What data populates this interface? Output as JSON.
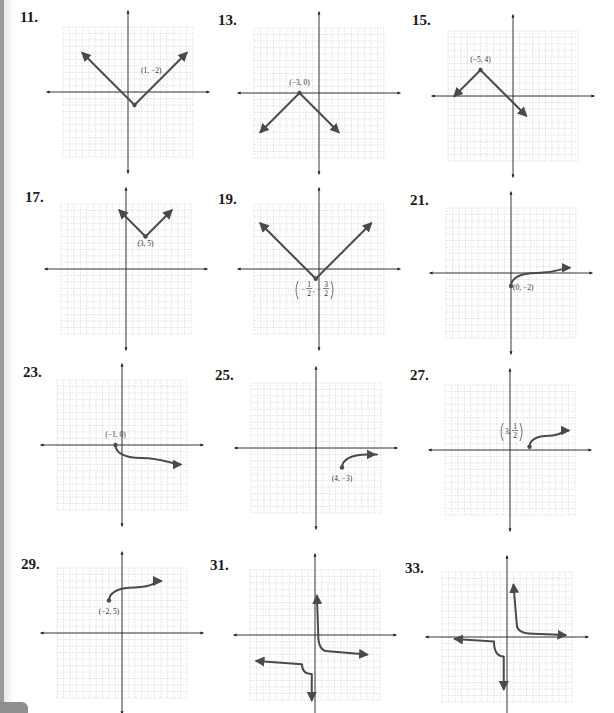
{
  "page": {
    "plots": [
      {
        "number": "11.",
        "label": "(1, −2)"
      },
      {
        "number": "13.",
        "label": "(−3, 0)"
      },
      {
        "number": "15.",
        "label": "(−5, 4)"
      },
      {
        "number": "17.",
        "label": "(3, 5)"
      },
      {
        "number": "19.",
        "label": "(−1/2, −3/2)"
      },
      {
        "number": "21.",
        "label": "(0, −2)"
      },
      {
        "number": "23.",
        "label": "(−1, 0)"
      },
      {
        "number": "25.",
        "label": "(4, −3)"
      },
      {
        "number": "27.",
        "label": "(3, 1/2)"
      },
      {
        "number": "29.",
        "label": "(−2, 5)"
      },
      {
        "number": "31.",
        "label": ""
      },
      {
        "number": "33.",
        "label": ""
      }
    ]
  },
  "colors": {
    "curve": "#4a4a4a",
    "axis": "#222222",
    "grid": "#d9d9d9",
    "text": "#1a1a1a"
  },
  "chart_data": [
    {
      "type": "line",
      "title": "11.",
      "description": "V-shaped absolute value graph",
      "vertex": [
        1,
        -2
      ],
      "annotation": "(1, −2)",
      "points": [
        [
          -7,
          6
        ],
        [
          1,
          -2
        ],
        [
          9,
          6
        ]
      ],
      "xlim": [
        -10,
        10
      ],
      "ylim": [
        -10,
        10
      ],
      "grid": true
    },
    {
      "type": "line",
      "title": "13.",
      "description": "Inverted V absolute value graph",
      "vertex": [
        -3,
        0
      ],
      "annotation": "(−3, 0)",
      "points": [
        [
          -9,
          -6
        ],
        [
          -3,
          0
        ],
        [
          3,
          -6
        ]
      ],
      "xlim": [
        -10,
        10
      ],
      "ylim": [
        -10,
        10
      ],
      "grid": true
    },
    {
      "type": "line",
      "title": "15.",
      "description": "Inverted V absolute value graph",
      "vertex": [
        -5,
        4
      ],
      "annotation": "(−5, 4)",
      "points": [
        [
          -9,
          0
        ],
        [
          -5,
          4
        ],
        [
          2,
          -3
        ]
      ],
      "xlim": [
        -10,
        10
      ],
      "ylim": [
        -10,
        10
      ],
      "grid": true
    },
    {
      "type": "line",
      "title": "17.",
      "description": "V-shaped absolute value graph",
      "vertex": [
        3,
        5
      ],
      "annotation": "(3, 5)",
      "points": [
        [
          -1,
          9
        ],
        [
          3,
          5
        ],
        [
          7,
          9
        ]
      ],
      "xlim": [
        -10,
        10
      ],
      "ylim": [
        -10,
        10
      ],
      "grid": true
    },
    {
      "type": "line",
      "title": "19.",
      "description": "V-shaped absolute value graph",
      "vertex": [
        -0.5,
        -1.5
      ],
      "annotation": "(−1/2, −3/2)",
      "points": [
        [
          -9,
          7
        ],
        [
          -0.5,
          -1.5
        ],
        [
          8,
          7
        ]
      ],
      "xlim": [
        -10,
        10
      ],
      "ylim": [
        -10,
        10
      ],
      "grid": true
    },
    {
      "type": "line",
      "title": "21.",
      "description": "Square root curve starting at endpoint",
      "vertex": [
        0,
        -2
      ],
      "annotation": "(0, −2)",
      "points": [
        [
          0,
          -2
        ],
        [
          1,
          -1
        ],
        [
          4,
          0
        ],
        [
          9,
          0.8
        ]
      ],
      "xlim": [
        -10,
        10
      ],
      "ylim": [
        -10,
        10
      ],
      "grid": true
    },
    {
      "type": "line",
      "title": "23.",
      "description": "Reflected square root curve",
      "vertex": [
        -1,
        0
      ],
      "annotation": "(−1, 0)",
      "points": [
        [
          -1,
          0
        ],
        [
          0,
          -1
        ],
        [
          3,
          -2
        ],
        [
          9,
          -3
        ]
      ],
      "xlim": [
        -10,
        10
      ],
      "ylim": [
        -10,
        10
      ],
      "grid": true
    },
    {
      "type": "line",
      "title": "25.",
      "description": "Square root curve starting at endpoint",
      "vertex": [
        4,
        -3
      ],
      "annotation": "(4, −3)",
      "points": [
        [
          4,
          -3
        ],
        [
          5,
          -2
        ],
        [
          8,
          -1
        ],
        [
          9,
          -1
        ]
      ],
      "xlim": [
        -10,
        10
      ],
      "ylim": [
        -10,
        10
      ],
      "grid": true
    },
    {
      "type": "line",
      "title": "27.",
      "description": "Square root curve starting at endpoint",
      "vertex": [
        3,
        0.5
      ],
      "annotation": "(3, 1/2)",
      "points": [
        [
          3,
          0.5
        ],
        [
          4,
          1.5
        ],
        [
          6,
          2.2
        ],
        [
          9,
          3
        ]
      ],
      "xlim": [
        -10,
        10
      ],
      "ylim": [
        -10,
        10
      ],
      "grid": true
    },
    {
      "type": "line",
      "title": "29.",
      "description": "Square root curve starting at endpoint",
      "vertex": [
        -2,
        5
      ],
      "annotation": "(−2, 5)",
      "points": [
        [
          -2,
          5
        ],
        [
          -1,
          6
        ],
        [
          2,
          7
        ],
        [
          6,
          8
        ]
      ],
      "xlim": [
        -10,
        10
      ],
      "ylim": [
        -10,
        10
      ],
      "grid": true
    },
    {
      "type": "line",
      "title": "31.",
      "description": "Hyperbola with branches in quadrants I/IV-ish and III",
      "series": [
        {
          "name": "right branch",
          "points": [
            [
              0.3,
              6
            ],
            [
              0.5,
              0
            ],
            [
              2,
              -2.5
            ],
            [
              8,
              -3
            ]
          ]
        },
        {
          "name": "left branch",
          "points": [
            [
              -9,
              -4
            ],
            [
              -2,
              -4.5
            ],
            [
              -0.5,
              -6
            ],
            [
              -0.5,
              -10
            ]
          ]
        }
      ],
      "xlim": [
        -10,
        10
      ],
      "ylim": [
        -10,
        10
      ],
      "grid": true
    },
    {
      "type": "line",
      "title": "33.",
      "description": "Hyperbola y = 1/x style",
      "series": [
        {
          "name": "right branch",
          "points": [
            [
              1,
              8
            ],
            [
              1.5,
              2
            ],
            [
              4,
              0.5
            ],
            [
              9,
              0.3
            ]
          ]
        },
        {
          "name": "left branch",
          "points": [
            [
              -8,
              -0.3
            ],
            [
              -2,
              -0.7
            ],
            [
              -0.5,
              -3
            ],
            [
              -0.5,
              -8
            ]
          ]
        }
      ],
      "xlim": [
        -10,
        10
      ],
      "ylim": [
        -10,
        10
      ],
      "grid": true
    }
  ]
}
